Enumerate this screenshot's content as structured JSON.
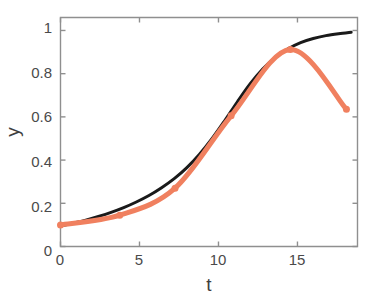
{
  "chart_data": {
    "type": "line",
    "title": "",
    "subtitle": "",
    "xlabel": "t",
    "ylabel": "y",
    "xlim": [
      0,
      18.8
    ],
    "ylim": [
      0,
      1.06
    ],
    "xticks": [
      0,
      5,
      10,
      15
    ],
    "xtick_labels": [
      "0",
      "5",
      "10",
      "15"
    ],
    "yticks": [
      0,
      0.2,
      0.4,
      0.6,
      0.8,
      1
    ],
    "ytick_labels": [
      "0",
      "0.2",
      "0.4",
      "0.6",
      "0.8",
      "1"
    ],
    "grid": false,
    "legend": "none",
    "box": true,
    "series": [
      {
        "name": "model-curve",
        "style": "solid-line",
        "color": "#1a1a1a",
        "linewidth": 3.0,
        "marker": "none",
        "x": [
          0.0,
          0.8,
          1.6,
          2.4,
          3.2,
          4.0,
          4.8,
          5.6,
          6.4,
          7.2,
          8.0,
          8.8,
          9.6,
          10.4,
          11.2,
          12.0,
          12.8,
          13.6,
          14.4,
          15.2,
          16.0,
          16.8,
          17.6,
          18.4
        ],
        "values": [
          0.095,
          0.108,
          0.122,
          0.139,
          0.158,
          0.18,
          0.206,
          0.236,
          0.272,
          0.314,
          0.365,
          0.427,
          0.5,
          0.583,
          0.67,
          0.752,
          0.821,
          0.875,
          0.915,
          0.944,
          0.963,
          0.976,
          0.985,
          0.992
        ]
      },
      {
        "name": "data-curve",
        "style": "solid-line-with-markers",
        "color": "#f0805f",
        "linewidth": 5.0,
        "marker": "circle",
        "markersize": 7,
        "x": [
          0.0,
          3.75,
          7.25,
          10.8,
          14.55,
          18.1
        ],
        "values": [
          0.1,
          0.145,
          0.27,
          0.605,
          0.912,
          0.635
        ]
      }
    ],
    "annotations": []
  },
  "axes": {
    "ylabel_text": "y",
    "xlabel_text": "t"
  },
  "colors": {
    "data_series": "#f0805f",
    "model_series": "#1a1a1a",
    "axis": "#8a8a8a",
    "tick_text": "#4a4a4a",
    "background": "#ffffff"
  }
}
